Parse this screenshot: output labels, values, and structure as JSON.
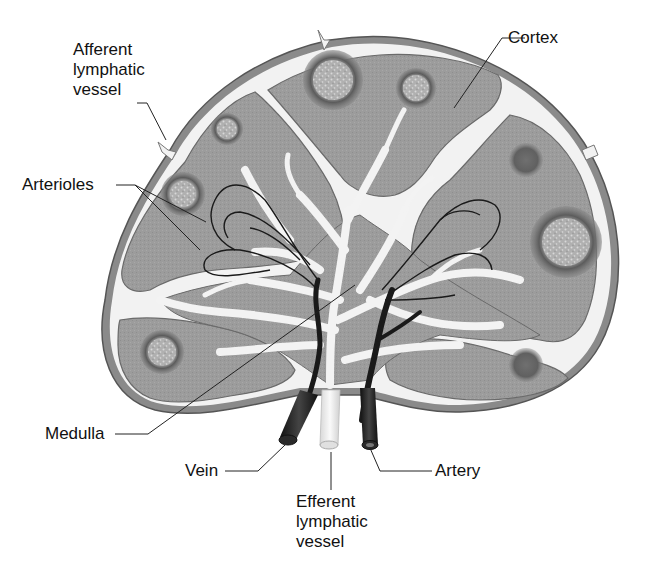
{
  "diagram": {
    "labels": {
      "afferent": "Afferent\nlymphatic\nvessel",
      "cortex": "Cortex",
      "arterioles": "Arterioles",
      "medulla": "Medulla",
      "vein": "Vein",
      "efferent": "Efferent\nlymphatic\nvessel",
      "artery": "Artery"
    },
    "colors": {
      "capsule": "#8a8a8a",
      "tissue": "#9a9a9a",
      "sinus": "#efefef",
      "follicle": "#6e6e6e",
      "germinal_center": "#bdbdbd",
      "vessel_dark": "#1e1e1e",
      "lymph_vessel": "#f4f4f4"
    }
  }
}
